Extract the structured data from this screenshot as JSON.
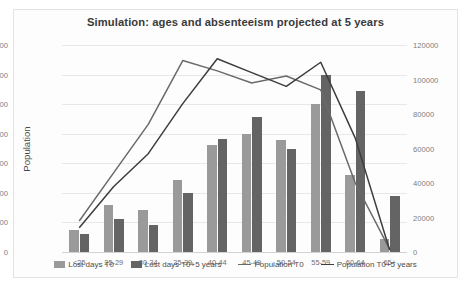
{
  "chart_data": {
    "type": "bar",
    "title": "Simulation: ages and absenteeism projected at 5 years",
    "xlabel": "",
    "ylabel": "Population",
    "y2label": "Absence days",
    "ylim": [
      0,
      7000
    ],
    "y2lim": [
      0,
      120000
    ],
    "yticks": [
      0,
      1000,
      2000,
      3000,
      4000,
      5000,
      6000,
      7000
    ],
    "y2ticks": [
      0,
      20000,
      40000,
      60000,
      80000,
      100000,
      120000
    ],
    "grid": true,
    "legend_position": "bottom",
    "categories": [
      "<25",
      "25-29",
      "30-34",
      "35-39",
      "40-44",
      "45-49",
      "50-54",
      "55-59",
      "60-64",
      "65+"
    ],
    "series": [
      {
        "name": "Lost days T0",
        "kind": "bar",
        "axis": "left",
        "color": "#9a9a9a",
        "values": [
          750,
          1600,
          1430,
          2450,
          3620,
          4000,
          3800,
          5000,
          2600,
          450
        ]
      },
      {
        "name": "Lost days T0+5 years",
        "kind": "bar",
        "axis": "left",
        "color": "#646464",
        "values": [
          620,
          1100,
          930,
          1980,
          3830,
          4550,
          3500,
          6000,
          5450,
          1900
        ]
      },
      {
        "name": "Population T0",
        "kind": "line",
        "axis": "right",
        "color": "#6a6a6a",
        "values": [
          18000,
          46000,
          74000,
          111000,
          105000,
          98000,
          102000,
          94000,
          40000,
          1500
        ]
      },
      {
        "name": "Population T0+5 years",
        "kind": "line",
        "axis": "right",
        "color": "#3d3d3d",
        "values": [
          14000,
          38000,
          57000,
          86000,
          112000,
          104000,
          96000,
          110000,
          66000,
          1000
        ]
      }
    ]
  },
  "legend": {
    "items": [
      {
        "label": "Lost days T0",
        "marker": "swatch-light"
      },
      {
        "label": "Lost days T0+5 years",
        "marker": "swatch-dark"
      },
      {
        "label": "Population T0",
        "marker": "line-light"
      },
      {
        "label": "Population T0+5 years",
        "marker": "line-dark"
      }
    ]
  }
}
